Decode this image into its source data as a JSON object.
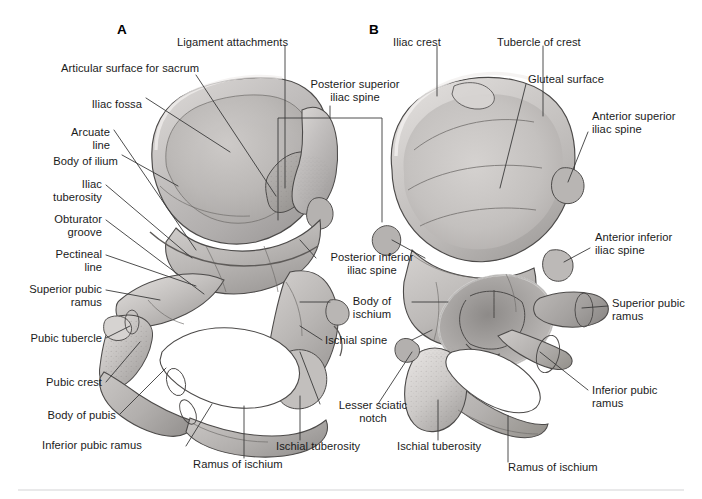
{
  "figure": {
    "panels": [
      {
        "id": "A",
        "x": 117,
        "y": 22,
        "view": "medial"
      },
      {
        "id": "B",
        "x": 369,
        "y": 22,
        "view": "lateral"
      }
    ]
  },
  "labels": {
    "left_column": [
      {
        "text": "Articular surface for sacrum",
        "x": 61,
        "y": 62,
        "align": "left",
        "width": 170
      },
      {
        "text": "Iliac fossa",
        "x": 40,
        "y": 98,
        "align": "right",
        "width": 102
      },
      {
        "text": "Arcuate\nline",
        "x": 40,
        "y": 126,
        "align": "right",
        "width": 70
      },
      {
        "text": "Body of ilium",
        "x": 20,
        "y": 155,
        "align": "right",
        "width": 98
      },
      {
        "text": "Iliac\ntuberosity",
        "x": 30,
        "y": 178,
        "align": "right",
        "width": 72
      },
      {
        "text": "Obturator\ngroove",
        "x": 30,
        "y": 213,
        "align": "right",
        "width": 72
      },
      {
        "text": "Pectineal\nline",
        "x": 30,
        "y": 248,
        "align": "right",
        "width": 72
      },
      {
        "text": "Superior pubic\nramus",
        "x": 12,
        "y": 283,
        "align": "right",
        "width": 90
      },
      {
        "text": "Pubic tubercle",
        "x": 12,
        "y": 332,
        "align": "right",
        "width": 90
      },
      {
        "text": "Pubic crest",
        "x": 16,
        "y": 376,
        "align": "right",
        "width": 86
      },
      {
        "text": "Body of pubis",
        "x": 22,
        "y": 415,
        "align": "right",
        "width": 94
      },
      {
        "text": "Inferior pubic ramus",
        "x": 42,
        "y": 445,
        "align": "left",
        "width": 140
      }
    ],
    "top_center": [
      {
        "text": "Ligament attachments",
        "x": 177,
        "y": 36,
        "align": "left",
        "width": 135
      },
      {
        "text": "Posterior superior\niliac spine",
        "x": 300,
        "y": 82,
        "align": "center",
        "width": 108
      }
    ],
    "center_column": [
      {
        "text": "Posterior inferior\niliac spine",
        "x": 318,
        "y": 252,
        "align": "center",
        "width": 106
      },
      {
        "text": "Body of\nischium",
        "x": 333,
        "y": 296,
        "align": "center",
        "width": 76
      },
      {
        "text": "Ischial spine",
        "x": 325,
        "y": 337,
        "align": "left",
        "width": 84
      },
      {
        "text": "Lesser sciatic\nnotch",
        "x": 326,
        "y": 403,
        "align": "center",
        "width": 92
      },
      {
        "text": "Ramus of ischium",
        "x": 193,
        "y": 463,
        "align": "left",
        "width": 110
      },
      {
        "text": "Ischial tuberosity",
        "x": 276,
        "y": 446,
        "align": "left",
        "width": 104
      }
    ],
    "right_column": [
      {
        "text": "Iliac crest",
        "x": 393,
        "y": 36,
        "align": "left",
        "width": 74
      },
      {
        "text": "Tubercle of crest",
        "x": 497,
        "y": 36,
        "align": "left",
        "width": 110
      },
      {
        "text": "Gluteal surface",
        "x": 528,
        "y": 75,
        "align": "left",
        "width": 100
      },
      {
        "text": "Anterior superior\niliac spine",
        "x": 592,
        "y": 113,
        "align": "left",
        "width": 100
      },
      {
        "text": "Anterior inferior\niliac spine",
        "x": 595,
        "y": 234,
        "align": "left",
        "width": 98
      },
      {
        "text": "Superior pubic\nramus",
        "x": 612,
        "y": 300,
        "align": "left",
        "width": 86
      },
      {
        "text": "Inferior pubic\nramus",
        "x": 592,
        "y": 387,
        "align": "left",
        "width": 86
      },
      {
        "text": "Ischial tuberosity",
        "x": 397,
        "y": 446,
        "align": "left",
        "width": 104
      },
      {
        "text": "Ramus of ischium",
        "x": 508,
        "y": 466,
        "align": "left",
        "width": 110
      }
    ]
  },
  "colors": {
    "bone_light": "#e6e4e3",
    "bone_mid": "#c9c6c5",
    "bone_dark": "#9b9896",
    "bone_deep": "#7c7977",
    "outline": "#4c4a49",
    "leader": "#3a3a3a",
    "text": "#1b1b1b",
    "footrule": "#e9e9ea",
    "background": "#ffffff"
  }
}
